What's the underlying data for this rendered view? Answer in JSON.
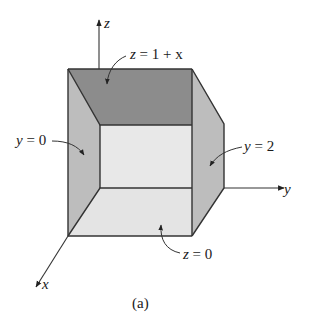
{
  "figure": {
    "caption": "(a)"
  },
  "axes": {
    "x_label": "x",
    "y_label": "y",
    "z_label": "z"
  },
  "surfaces": [
    {
      "id": "top",
      "label": "z = 1 + x",
      "equation_lhs": "z",
      "equation_rhs": "1 + x",
      "shade": "#8c8c8c"
    },
    {
      "id": "left",
      "label": "y = 0",
      "equation_lhs": "y",
      "equation_rhs": "0",
      "shade": "#bdbdbd"
    },
    {
      "id": "right",
      "label": "y = 2",
      "equation_lhs": "y",
      "equation_rhs": "2",
      "shade": "#bdbdbd"
    },
    {
      "id": "bottom",
      "label": "z = 0",
      "equation_lhs": "z",
      "equation_rhs": "0",
      "shade": "#e4e4e4"
    }
  ],
  "colors": {
    "back_face": "#e8e8e8",
    "edge": "#333333"
  }
}
